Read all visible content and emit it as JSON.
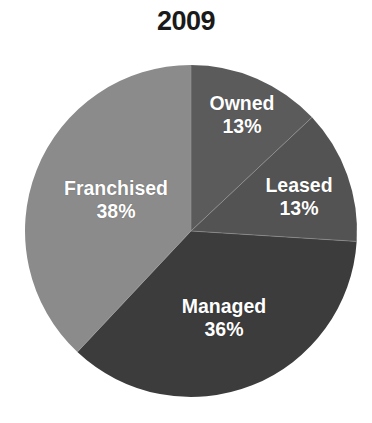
{
  "chart_data": {
    "type": "pie",
    "title": "2009",
    "xlabel": "",
    "ylabel": "",
    "legend": "none",
    "labels_inside_slices": true,
    "start_angle_deg": 0,
    "direction": "clockwise",
    "categories": [
      "Owned",
      "Leased",
      "Managed",
      "Franchised"
    ],
    "values": [
      13,
      13,
      36,
      38
    ],
    "value_unit": "%",
    "slices": [
      {
        "name": "Owned",
        "value": 13,
        "display_value": "13%",
        "color": "#5b5b5b",
        "start_angle_deg": 0,
        "end_angle_deg": 46.8,
        "label_x": 242,
        "label_y": 115
      },
      {
        "name": "Leased",
        "value": 13,
        "display_value": "13%",
        "color": "#535353",
        "start_angle_deg": 46.8,
        "end_angle_deg": 93.6,
        "label_x": 299,
        "label_y": 197
      },
      {
        "name": "Managed",
        "value": 36,
        "display_value": "36%",
        "color": "#3c3c3c",
        "start_angle_deg": 93.6,
        "end_angle_deg": 223.2,
        "label_x": 224,
        "label_y": 318
      },
      {
        "name": "Franchised",
        "value": 38,
        "display_value": "38%",
        "color": "#8b8b8b",
        "start_angle_deg": 223.2,
        "end_angle_deg": 360,
        "label_x": 116,
        "label_y": 200
      }
    ],
    "geometry": {
      "center_x": 191,
      "center_y": 231,
      "radius": 166
    },
    "colors": {
      "background": "#ffffff",
      "title_text": "#1a1a1a",
      "label_text": "#ffffff",
      "divider": "#9a9a9a"
    }
  }
}
